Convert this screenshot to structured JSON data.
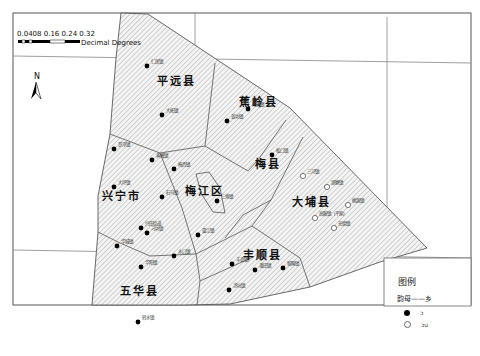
{
  "scale_bar": {
    "ticks_label": "0 0.04 0.08 0.16 0.24 0.32",
    "ticks_display": "0.0408 0.16 0.24 0.32",
    "ticks_prefix": "0.0",
    "units": "Decimal Degrees"
  },
  "north_arrow": {
    "label": "N"
  },
  "counties": [
    {
      "name": "平远县",
      "x": 176,
      "y": 85
    },
    {
      "name": "蕉岭县",
      "x": 258,
      "y": 106
    },
    {
      "name": "梅县",
      "x": 268,
      "y": 168
    },
    {
      "name": "大埔县",
      "x": 311,
      "y": 206
    },
    {
      "name": "兴宁市",
      "x": 121,
      "y": 200
    },
    {
      "name": "梅江区",
      "x": 204,
      "y": 195
    },
    {
      "name": "丰顺县",
      "x": 262,
      "y": 259
    },
    {
      "name": "五华县",
      "x": 139,
      "y": 295
    }
  ],
  "towns_filled": [
    {
      "name": "仁居镇",
      "x": 147,
      "y": 66
    },
    {
      "name": "大柘镇",
      "x": 162,
      "y": 115
    },
    {
      "name": "南礤镇",
      "x": 248,
      "y": 109
    },
    {
      "name": "蓝坊镇",
      "x": 227,
      "y": 121
    },
    {
      "name": "罗浮镇",
      "x": 114,
      "y": 149
    },
    {
      "name": "黄槐镇",
      "x": 152,
      "y": 160
    },
    {
      "name": "梅西镇",
      "x": 174,
      "y": 169
    },
    {
      "name": "松口镇",
      "x": 272,
      "y": 155
    },
    {
      "name": "大坪镇",
      "x": 114,
      "y": 187
    },
    {
      "name": "石马镇",
      "x": 162,
      "y": 197
    },
    {
      "name": "三角镇",
      "x": 217,
      "y": 201
    },
    {
      "name": "兴田街道",
      "x": 141,
      "y": 228
    },
    {
      "name": "刁坊镇",
      "x": 147,
      "y": 233
    },
    {
      "name": "华城镇",
      "x": 117,
      "y": 246
    },
    {
      "name": "畲江镇",
      "x": 198,
      "y": 235
    },
    {
      "name": "水口镇",
      "x": 174,
      "y": 256
    },
    {
      "name": "华阳镇",
      "x": 141,
      "y": 267
    },
    {
      "name": "转水镇",
      "x": 138,
      "y": 322
    },
    {
      "name": "丰良镇",
      "x": 232,
      "y": 264
    },
    {
      "name": "潘田镇",
      "x": 255,
      "y": 270
    },
    {
      "name": "留隍镇",
      "x": 283,
      "y": 268
    },
    {
      "name": "汤坑镇",
      "x": 229,
      "y": 290
    }
  ],
  "towns_hollow": [
    {
      "name": "三河镇",
      "x": 303,
      "y": 176
    },
    {
      "name": "湖寮镇",
      "x": 327,
      "y": 187
    },
    {
      "name": "桃源镇",
      "x": 348,
      "y": 205
    },
    {
      "name": "高陂镇（平原）",
      "x": 315,
      "y": 218
    },
    {
      "name": "光德镇",
      "x": 334,
      "y": 228
    }
  ],
  "legend": {
    "title": "图例",
    "subtitle": "韵母——乡",
    "items": [
      {
        "symbol": "filled-circle",
        "label": "ɔ"
      },
      {
        "symbol": "hollow-circle",
        "label": "ɔu"
      }
    ]
  }
}
